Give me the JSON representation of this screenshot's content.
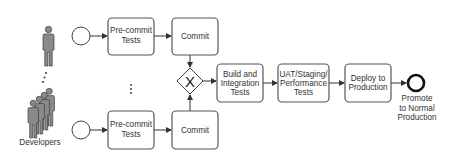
{
  "diagram": {
    "actors": {
      "label": "Developers"
    },
    "top_row": {
      "precommit": [
        "Pre-commit",
        "Tests"
      ],
      "commit": "Commit"
    },
    "bottom_row": {
      "precommit": [
        "Pre-commit",
        "Tests"
      ],
      "commit": "Commit"
    },
    "gateway": {
      "symbol": "X",
      "type": "exclusive-gateway"
    },
    "pipeline": {
      "build": [
        "Build and",
        "Integration",
        "Tests"
      ],
      "uat": [
        "UAT/Staging/",
        "Performance",
        "Tests"
      ],
      "deploy": [
        "Deploy to",
        "Production"
      ]
    },
    "end_event": {
      "label": [
        "Promote",
        "to Normal",
        "Production"
      ]
    },
    "ellipsis": "⋮",
    "colors": {
      "box_stroke": "#555555",
      "person_fill": "#8a8a8a",
      "text": "#333333"
    }
  }
}
